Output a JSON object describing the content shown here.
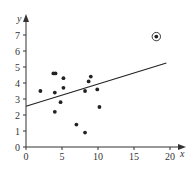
{
  "chart_data": {
    "type": "scatter",
    "title": "",
    "xlabel": "x",
    "ylabel": "y",
    "xlim": [
      0,
      20
    ],
    "ylim": [
      0,
      7.5
    ],
    "x_ticks": [
      0,
      5,
      10,
      15,
      20
    ],
    "y_ticks": [
      0,
      1,
      2,
      3,
      4,
      5,
      6,
      7
    ],
    "grid": false,
    "legend": null,
    "points": [
      {
        "x": 2.0,
        "y": 3.5
      },
      {
        "x": 3.8,
        "y": 4.6
      },
      {
        "x": 4.1,
        "y": 4.6
      },
      {
        "x": 5.2,
        "y": 4.3
      },
      {
        "x": 4.0,
        "y": 3.4
      },
      {
        "x": 5.2,
        "y": 3.7
      },
      {
        "x": 4.8,
        "y": 2.8
      },
      {
        "x": 4.0,
        "y": 2.2
      },
      {
        "x": 7.0,
        "y": 1.4
      },
      {
        "x": 8.2,
        "y": 0.9
      },
      {
        "x": 8.2,
        "y": 3.5
      },
      {
        "x": 8.7,
        "y": 4.1
      },
      {
        "x": 9.0,
        "y": 4.4
      },
      {
        "x": 9.9,
        "y": 3.6
      },
      {
        "x": 10.2,
        "y": 2.5
      },
      {
        "x": 18.1,
        "y": 6.9,
        "highlighted": true
      }
    ],
    "trend_line": {
      "x1": 0,
      "y1": 2.55,
      "x2": 19.5,
      "y2": 5.25
    },
    "annotations": [
      "Outlier point at (18.1, 6.9) is circled"
    ]
  },
  "colors": {
    "axis": "#333333",
    "points": "#222222",
    "line": "#222222"
  }
}
